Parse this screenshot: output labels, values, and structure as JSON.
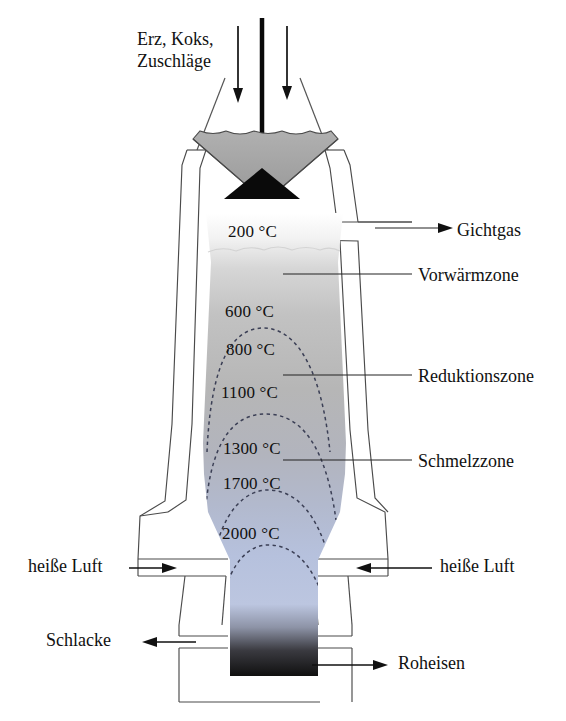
{
  "diagram": {
    "language": "de"
  },
  "feed": {
    "label_line1": "Erz, Koks,",
    "label_line2": "Zuschläge",
    "arrow_icon": "down-arrow-icon",
    "charge_count": 2
  },
  "temperatures": [
    {
      "id": "t200",
      "label": "200 °C",
      "value": 200,
      "unit": "°C",
      "x": 268,
      "y": 231
    },
    {
      "id": "t600",
      "label": "600 °C",
      "value": 600,
      "unit": "°C",
      "x": 262,
      "y": 311
    },
    {
      "id": "t800",
      "label": "800 °C",
      "value": 800,
      "unit": "°C",
      "x": 264,
      "y": 349
    },
    {
      "id": "t1100",
      "label": "1100 °C",
      "value": 1100,
      "unit": "°C",
      "x": 262,
      "y": 392
    },
    {
      "id": "t1300",
      "label": "1300 °C",
      "value": 1300,
      "unit": "°C",
      "x": 264,
      "y": 448
    },
    {
      "id": "t1700",
      "label": "1700 °C",
      "value": 1700,
      "unit": "°C",
      "x": 264,
      "y": 483
    },
    {
      "id": "t2000",
      "label": "2000 °C",
      "value": 2000,
      "unit": "°C",
      "x": 264,
      "y": 533
    }
  ],
  "right_labels": [
    {
      "id": "gichtgas",
      "label": "Gichtgas",
      "x": 455,
      "y": 234,
      "connector": "arrow-right"
    },
    {
      "id": "vorwaermzone",
      "label": "Vorwärmzone",
      "x": 420,
      "y": 278,
      "connector": "leader-line"
    },
    {
      "id": "reduktionszone",
      "label": "Reduktionszone",
      "x": 420,
      "y": 379,
      "connector": "leader-line"
    },
    {
      "id": "schmelzzone",
      "label": "Schmelzzone",
      "x": 420,
      "y": 464,
      "connector": "leader-line"
    }
  ],
  "air_labels": [
    {
      "id": "heisse-luft-left",
      "label": "heiße Luft",
      "x": 26,
      "y": 565,
      "connector": "arrow-right"
    },
    {
      "id": "heisse-luft-right",
      "label": "heiße Luft",
      "x": 440,
      "y": 565,
      "connector": "arrow-left"
    }
  ],
  "tap_labels": [
    {
      "id": "schlacke",
      "label": "Schlacke",
      "x": 46,
      "y": 637,
      "connector": "arrow-left"
    },
    {
      "id": "roheisen",
      "label": "Roheisen",
      "x": 400,
      "y": 660,
      "connector": "arrow-right"
    }
  ],
  "zones": {
    "preheat": "Vorwärmzone",
    "reduction": "Reduktionszone",
    "melting": "Schmelzzone",
    "top_gas": "Gichtgas",
    "hot_air": "heiße Luft",
    "slag": "Schlacke",
    "pig_iron": "Roheisen"
  },
  "colors": {
    "outline": "#4a4a4a",
    "charge_fill": "#a8a8a8",
    "bell_fill": "#0a0a0a",
    "gradient_top": "#ffffff",
    "gradient_mid": "#b4b4b4",
    "gradient_blue": "#b6c1dd",
    "gradient_iron": "#121212",
    "isotherm": "#3b3f55",
    "text": "#111111",
    "background": "#ffffff"
  },
  "isotherm_count": 4
}
